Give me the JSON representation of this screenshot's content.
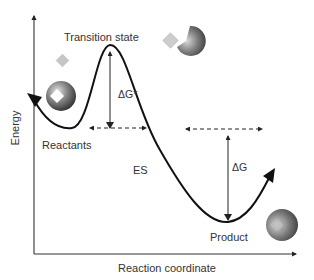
{
  "diagram": {
    "type": "reaction-energy-profile",
    "axes": {
      "x_label": "Reaction coordinate",
      "y_label": "Energy"
    },
    "labels": {
      "transition_state": "Transition state",
      "activation_energy": "ΔG*",
      "reactants": "Reactants",
      "enzyme_substrate": "ES",
      "free_energy_change": "ΔG",
      "product": "Product"
    },
    "colors": {
      "curve": "#111111",
      "axis": "#333333",
      "dashed": "#222222",
      "sphere_dark": "#3a3a3a",
      "sphere_light": "#bdbdbd",
      "diamond": "#c8c8c8",
      "text": "#333333"
    },
    "glyphs": {
      "reactants_enzyme": "sphere-with-bound-diamond",
      "free_substrate": "diamond",
      "transition_enzyme": "pacman-sphere-with-diamond",
      "product_enzyme": "sphere-with-notch"
    }
  }
}
